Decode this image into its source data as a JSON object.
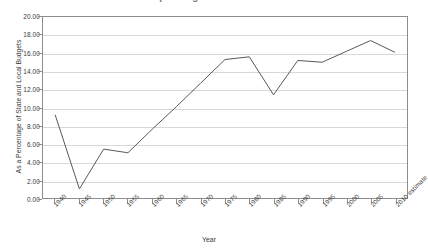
{
  "chart_data": {
    "type": "line",
    "title": "Local Government Spending",
    "xlabel": "Year",
    "ylabel": "As a Percentage of State and Local Budgets",
    "ylim": [
      0.0,
      20.0
    ],
    "ytick_step": 2.0,
    "ytick_labels": [
      "0.00",
      "2.00",
      "4.00",
      "6.00",
      "8.00",
      "10.00",
      "12.00",
      "14.00",
      "16.00",
      "18.00",
      "20.00"
    ],
    "ytick_values": [
      0,
      2,
      4,
      6,
      8,
      10,
      12,
      14,
      16,
      18,
      20
    ],
    "grid": true,
    "legend": "none",
    "categories": [
      "1940",
      "1945",
      "1950",
      "1955",
      "1960",
      "1965",
      "1970",
      "1975",
      "1980",
      "1985",
      "1990",
      "1995",
      "2000",
      "2005",
      "2010 estimate"
    ],
    "values": [
      9.2,
      1.0,
      5.4,
      5.0,
      7.6,
      10.1,
      12.7,
      15.3,
      15.6,
      11.4,
      15.2,
      15.0,
      16.2,
      17.4,
      16.1
    ],
    "series": [
      {
        "name": "As a Percentage of State and Local Budgets",
        "color": "#595959",
        "values": [
          9.2,
          1.0,
          5.4,
          5.0,
          7.6,
          10.1,
          12.7,
          15.3,
          15.6,
          11.4,
          15.2,
          15.0,
          16.2,
          17.4,
          16.1
        ]
      }
    ]
  },
  "colors": {
    "line": "#595959",
    "grid": "#d8d8d8",
    "frame": "#8d8d8d",
    "text": "#3d3d3d",
    "background": "#ffffff"
  }
}
